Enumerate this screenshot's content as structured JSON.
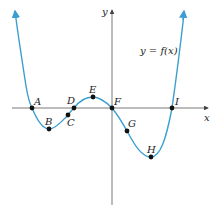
{
  "figure": {
    "function_label": "y = f(x)",
    "x_axis_label": "x",
    "y_axis_label": "y",
    "curve_color": "#3a9fd0",
    "axis_color": "#555555",
    "points": [
      {
        "name": "A",
        "x": 32,
        "y": 108
      },
      {
        "name": "B",
        "x": 49,
        "y": 129
      },
      {
        "name": "C",
        "x": 68,
        "y": 115
      },
      {
        "name": "D",
        "x": 74,
        "y": 108
      },
      {
        "name": "E",
        "x": 93,
        "y": 97
      },
      {
        "name": "F",
        "x": 112,
        "y": 108
      },
      {
        "name": "G",
        "x": 127,
        "y": 131
      },
      {
        "name": "H",
        "x": 151,
        "y": 157
      },
      {
        "name": "I",
        "x": 172,
        "y": 108
      }
    ]
  }
}
